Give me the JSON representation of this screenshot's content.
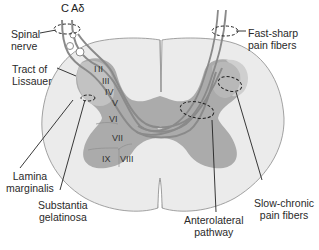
{
  "figure": {
    "colors": {
      "background": "#ffffff",
      "white_matter": "#e9e9e9",
      "gray_matter": "#a9a9a9",
      "dorsal_horn_cap": "#c4c4c4",
      "fiber": "#8a8a8a",
      "line": "#222222"
    }
  },
  "fiber_labels": {
    "c": "C",
    "a_delta": "Aδ"
  },
  "labels": {
    "spinal_nerve": [
      "Spinal",
      "nerve"
    ],
    "tract_of_lissauer": [
      "Tract of",
      "Lissauer"
    ],
    "lamina_marginalis": [
      "Lamina",
      "marginalis"
    ],
    "substantia_gelatinosa": [
      "Substantia",
      "gelatinosa"
    ],
    "fast_sharp": [
      "Fast-sharp",
      "pain fibers"
    ],
    "slow_chronic": [
      "Slow-chronic",
      "pain fibers"
    ],
    "anterolateral": [
      "Anterolateral",
      "pathway"
    ]
  },
  "laminae": [
    "I",
    "II",
    "III",
    "IV",
    "V",
    "VI",
    "VII",
    "VIII",
    "IX"
  ]
}
